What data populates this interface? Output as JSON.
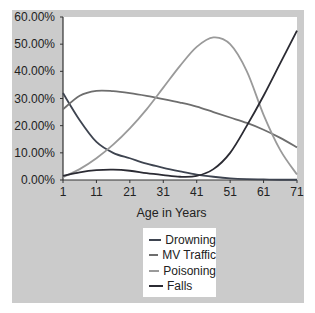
{
  "chart_data": {
    "type": "line",
    "title": "",
    "xlabel": "Age in Years",
    "ylabel": "",
    "x": [
      1,
      6,
      11,
      16,
      21,
      26,
      31,
      36,
      41,
      46,
      51,
      56,
      61,
      66,
      71
    ],
    "x_ticks": [
      "1",
      "11",
      "21",
      "31",
      "41",
      "51",
      "61",
      "71"
    ],
    "y_ticks": [
      "0.00%",
      "10.00%",
      "20.00%",
      "30.00%",
      "40.00%",
      "50.00%",
      "60.00%"
    ],
    "ylim": [
      0,
      60
    ],
    "xlim": [
      1,
      71
    ],
    "grid": false,
    "legend_position": "bottom-center",
    "series": [
      {
        "name": "Drowning",
        "color": "#3e4450",
        "values": [
          32,
          22,
          14,
          10,
          8,
          6,
          4.5,
          3.2,
          2,
          1.2,
          0.6,
          0.3,
          0.2,
          0.1,
          0.1
        ]
      },
      {
        "name": "MV Traffic",
        "color": "#6e6e6e",
        "values": [
          26,
          31,
          32.8,
          32.7,
          32,
          31,
          29.8,
          28.5,
          27,
          25,
          23,
          21,
          18.5,
          15.5,
          12
        ]
      },
      {
        "name": "Poisoning",
        "color": "#9a9a9a",
        "values": [
          1,
          4,
          8,
          13,
          19,
          26,
          34,
          42,
          49,
          52.5,
          50,
          40,
          24,
          11,
          2
        ]
      },
      {
        "name": "Falls",
        "color": "#2b2b33",
        "values": [
          1.5,
          2.8,
          3.6,
          3.8,
          3.4,
          2.5,
          1.8,
          1.2,
          1.5,
          4,
          10,
          20,
          31,
          43,
          55
        ]
      }
    ]
  },
  "legend": {
    "items": [
      {
        "label": "Drowning",
        "color": "#3e4450"
      },
      {
        "label": "MV Traffic",
        "color": "#6e6e6e"
      },
      {
        "label": "Poisoning",
        "color": "#9a9a9a"
      },
      {
        "label": "Falls",
        "color": "#2b2b33"
      }
    ]
  }
}
